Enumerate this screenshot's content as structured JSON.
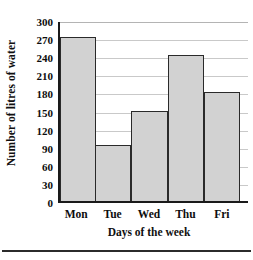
{
  "chart_data": {
    "type": "bar",
    "title": "",
    "xlabel": "Days of the week",
    "ylabel": "Number of litres of water",
    "categories": [
      "Mon",
      "Tue",
      "Wed",
      "Thu",
      "Fri"
    ],
    "values": [
      272,
      93,
      150,
      242,
      180
    ],
    "ylim": [
      0,
      300
    ],
    "ytick_labels": [
      "0",
      "30",
      "60",
      "90",
      "120",
      "150",
      "180",
      "210",
      "240",
      "270",
      "300"
    ],
    "ytick_values": [
      0,
      30,
      60,
      90,
      120,
      150,
      180,
      210,
      240,
      270,
      300
    ],
    "ytick_step": 30,
    "grid": true,
    "legend": false,
    "bar_fill_color": "#d2d2d2",
    "bar_border_color": "#2a2a2a",
    "axis_color": "#1a1a1a",
    "gridline_color": "#c9c9c9"
  }
}
